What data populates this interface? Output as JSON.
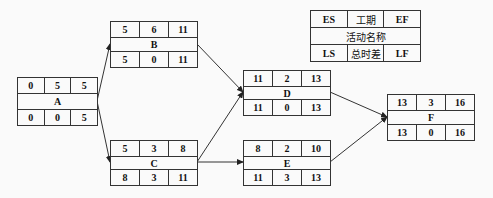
{
  "legend": {
    "top": [
      "ES",
      "工期",
      "EF"
    ],
    "name": "活动名称",
    "bottom": [
      "LS",
      "总时差",
      "LF"
    ]
  },
  "nodes": {
    "A": {
      "name": "A",
      "es": "0",
      "dur": "5",
      "ef": "5",
      "ls": "0",
      "tf": "0",
      "lf": "5"
    },
    "B": {
      "name": "B",
      "es": "5",
      "dur": "6",
      "ef": "11",
      "ls": "5",
      "tf": "0",
      "lf": "11"
    },
    "C": {
      "name": "C",
      "es": "5",
      "dur": "3",
      "ef": "8",
      "ls": "8",
      "tf": "3",
      "lf": "11"
    },
    "D": {
      "name": "D",
      "es": "11",
      "dur": "2",
      "ef": "13",
      "ls": "11",
      "tf": "0",
      "lf": "13"
    },
    "E": {
      "name": "E",
      "es": "8",
      "dur": "2",
      "ef": "10",
      "ls": "11",
      "tf": "3",
      "lf": "13"
    },
    "F": {
      "name": "F",
      "es": "13",
      "dur": "3",
      "ef": "16",
      "ls": "13",
      "tf": "0",
      "lf": "16"
    }
  },
  "edges": [
    {
      "from": "A",
      "to": "B"
    },
    {
      "from": "A",
      "to": "C"
    },
    {
      "from": "B",
      "to": "D"
    },
    {
      "from": "C",
      "to": "D"
    },
    {
      "from": "C",
      "to": "E"
    },
    {
      "from": "D",
      "to": "F"
    },
    {
      "from": "E",
      "to": "F"
    }
  ],
  "colors": {
    "line": "#333333",
    "background": "#fafafa",
    "text": "#111111"
  }
}
